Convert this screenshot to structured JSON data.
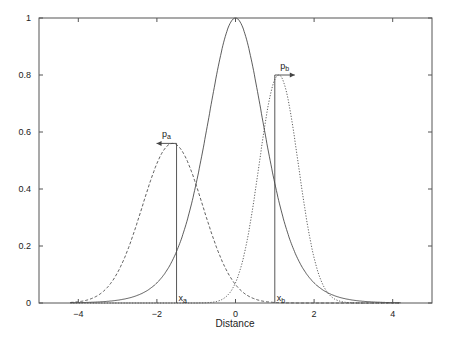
{
  "chart_data": {
    "type": "line",
    "title": "",
    "xlabel": "Distance",
    "ylabel": "",
    "xlim": [
      -5,
      5
    ],
    "ylim": [
      0,
      1
    ],
    "xticks": [
      -4,
      -2,
      0,
      2,
      4
    ],
    "xtick_labels": [
      "−4",
      "−2",
      "0",
      "2",
      "4"
    ],
    "yticks": [
      0,
      0.2,
      0.4,
      0.6,
      0.8,
      1
    ],
    "ytick_labels": [
      "0",
      "0.2",
      "0.4",
      "0.6",
      "0.8",
      "1"
    ],
    "grid": false,
    "legend": null,
    "series": [
      {
        "name": "central (solid)",
        "style": "solid",
        "shape": "sech^2",
        "center": 0,
        "peak": 1.0,
        "x": [
          -4,
          -3,
          -2,
          -1.5,
          -1,
          -0.5,
          0,
          0.5,
          1,
          1.5,
          2,
          3,
          4
        ],
        "y": [
          0.001,
          0.01,
          0.07,
          0.18,
          0.42,
          0.79,
          1.0,
          0.79,
          0.42,
          0.18,
          0.07,
          0.01,
          0.001
        ]
      },
      {
        "name": "p_a (dashed)",
        "style": "dashed",
        "shape": "gaussian",
        "center": -1.6,
        "peak": 0.56,
        "sigma": 0.77,
        "x": [
          -4,
          -3,
          -2.5,
          -2,
          -1.6,
          -1,
          -0.5,
          0,
          1
        ],
        "y": [
          0.005,
          0.12,
          0.28,
          0.49,
          0.56,
          0.41,
          0.2,
          0.06,
          0.0
        ]
      },
      {
        "name": "p_b (dotted)",
        "style": "dotted",
        "shape": "gaussian",
        "center": 1.1,
        "peak": 0.8,
        "sigma": 0.5,
        "x": [
          -0.5,
          0,
          0.5,
          1.1,
          1.5,
          2,
          2.5,
          3
        ],
        "y": [
          0.005,
          0.07,
          0.38,
          0.8,
          0.58,
          0.16,
          0.02,
          0.0
        ]
      }
    ],
    "annotations": [
      {
        "label": "x_a",
        "text_main": "x",
        "text_sub": "a",
        "x": -1.5,
        "type": "vertical-line",
        "top": 0.56
      },
      {
        "label": "x_b",
        "text_main": "x",
        "text_sub": "b",
        "x": 1.0,
        "type": "vertical-line",
        "top": 0.8
      },
      {
        "label": "p_a",
        "text_main": "p",
        "text_sub": "a",
        "arrow": "left",
        "at": [
          -1.5,
          0.56
        ]
      },
      {
        "label": "p_b",
        "text_main": "p",
        "text_sub": "b",
        "arrow": "right",
        "at": [
          1.0,
          0.8
        ]
      }
    ]
  },
  "caption_partial": "Fig. ... (caption truncated at bottom edge)"
}
